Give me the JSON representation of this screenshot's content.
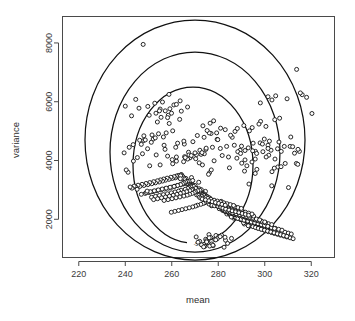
{
  "figure": {
    "kind": "scatterplot-with-density-contours",
    "background": "#ffffff",
    "frame_color": "#4a4a4a",
    "point_stroke": "#111111",
    "point_fill": "#ffffff",
    "contour_color": "#111111"
  },
  "chart_data": {
    "type": "scatter",
    "title": "",
    "xlabel": "mean",
    "ylabel": "variance",
    "xlim": [
      213,
      330
    ],
    "ylim": [
      700,
      8900
    ],
    "grid": false,
    "legend": null,
    "xticks": [
      220,
      240,
      260,
      280,
      300,
      320
    ],
    "xticklabels": [
      "220",
      "240",
      "260",
      "280",
      "300",
      "320"
    ],
    "yticks": [
      2000,
      4000,
      6000,
      8000
    ],
    "yticklabels": [
      "2000",
      "4000",
      "6000",
      "8000"
    ],
    "marker": "open-circle",
    "n_points": 733,
    "cluster_center": [
      277,
      2650
    ],
    "contour_labels": [
      "-5.5"
    ],
    "contours": [
      {
        "level": "outer",
        "cx": 278,
        "cy": 3200,
        "rx": 48,
        "ry": 4050,
        "label": null
      },
      {
        "level": "middle",
        "cx": 278,
        "cy": 2950,
        "rx": 37,
        "ry": 3050,
        "label": null
      },
      {
        "level": "inner",
        "cx": 277,
        "cy": 2700,
        "rx": 26,
        "ry": 2050,
        "label": "-5.5"
      }
    ],
    "x": [
      275.6,
      282.1,
      271.4,
      279.8,
      268.2,
      285.3,
      273.9,
      277.1,
      290.4,
      265.7,
      281.3,
      274.5,
      269.8,
      288.2,
      276.4,
      272.0,
      283.7,
      266.3,
      279.1,
      291.5,
      270.6,
      277.8,
      284.9,
      263.4,
      274.2,
      286.6,
      268.9,
      280.5,
      273.1,
      292.8,
      266.8,
      278.3,
      285.1,
      271.7,
      275.0,
      289.6,
      264.2,
      282.4,
      276.9,
      269.3,
      287.5,
      273.4,
      280.8,
      265.1,
      277.2,
      291.0,
      270.1,
      284.2,
      274.8,
      267.6,
      281.9,
      288.9,
      272.6,
      276.1,
      293.4,
      268.4,
      279.5,
      285.8,
      271.0,
      274.3,
      290.2,
      266.1,
      283.1,
      277.6,
      269.9,
      286.3,
      272.9,
      280.1,
      264.8,
      275.4,
      292.1,
      270.8,
      284.7,
      273.6,
      268.1,
      282.6,
      289.3,
      271.3,
      276.7,
      294.0,
      267.2,
      279.0,
      286.9,
      270.4,
      274.9,
      291.7,
      265.5,
      283.5,
      278.1,
      268.7,
      287.8,
      273.0,
      281.2,
      263.9,
      276.3,
      292.5,
      269.6,
      285.4,
      275.1,
      267.0,
      282.0,
      290.6,
      272.2,
      277.4,
      295.1,
      266.5,
      278.6,
      288.0,
      271.8,
      273.7,
      293.0,
      264.4,
      284.0,
      276.0,
      270.0,
      287.1,
      272.4,
      280.4,
      262.7,
      275.7,
      291.2,
      269.1,
      285.9,
      274.0,
      267.9,
      283.3,
      288.5,
      270.9,
      277.0,
      296.2,
      265.9,
      279.7,
      286.1,
      272.7,
      275.3,
      290.9,
      263.1,
      284.5,
      278.8,
      269.4,
      287.3,
      273.3,
      281.6,
      262.0,
      276.6,
      293.7,
      270.3,
      286.4,
      275.9,
      266.7,
      282.9,
      291.9,
      271.5,
      278.0,
      297.0,
      264.9,
      280.2,
      289.0,
      272.1,
      274.6,
      294.5,
      261.5,
      285.0,
      277.3,
      268.3,
      288.3,
      273.8,
      282.2,
      261.0,
      275.2,
      292.9,
      269.0,
      287.0,
      274.4,
      266.0,
      284.3,
      290.0,
      270.7,
      278.9,
      298.3,
      263.6,
      281.0,
      285.6,
      271.2,
      276.5,
      295.8,
      260.2,
      286.0,
      278.4,
      267.4,
      289.5,
      272.3,
      283.0,
      259.6,
      274.1,
      294.9,
      268.6,
      288.6,
      275.8,
      265.3,
      285.5,
      292.4,
      271.6,
      279.4,
      299.5,
      262.3,
      281.8,
      287.6,
      270.2,
      277.9,
      297.6,
      258.8,
      286.8,
      279.9,
      266.9,
      290.3,
      273.2,
      284.1,
      258.0,
      273.5,
      296.0,
      267.8,
      289.8,
      276.2,
      264.6,
      286.5,
      293.6,
      272.8,
      280.7,
      300.4,
      261.2,
      282.8,
      288.4,
      269.7,
      278.5,
      298.9,
      257.3,
      287.9,
      281.1,
      265.8,
      291.4,
      274.7,
      285.2,
      256.5,
      272.5,
      297.2,
      266.4,
      290.8,
      277.5,
      263.8,
      287.4,
      294.8,
      271.9,
      282.3,
      301.6,
      260.0,
      283.9,
      289.9,
      268.8,
      279.3,
      300.1,
      256.0,
      289.1,
      282.0,
      264.0,
      292.6,
      275.5,
      286.2,
      255.1,
      271.1,
      298.5,
      265.0,
      292.0,
      278.7,
      262.5,
      288.8,
      296.1,
      272.5,
      283.4,
      302.9,
      258.6,
      285.1,
      291.1,
      267.7,
      280.6,
      301.3,
      254.6,
      290.5,
      283.2,
      262.9,
      294.0,
      276.8,
      287.7,
      253.8,
      270.2,
      299.9,
      263.7,
      293.3,
      280.0,
      261.0,
      290.1,
      297.5,
      273.1,
      284.8,
      304.1,
      257.0,
      286.7,
      292.7,
      266.6,
      281.5,
      302.8,
      253.0,
      291.8,
      284.6,
      261.4,
      295.6,
      278.2,
      289.2,
      252.2,
      269.0,
      301.2,
      262.2,
      294.6,
      281.4,
      259.3,
      291.6,
      299.0,
      274.5,
      286.1,
      305.5,
      255.4,
      288.1,
      294.2,
      265.2,
      283.0,
      304.4,
      251.4,
      293.2,
      286.0,
      259.8,
      297.1,
      279.6,
      290.7,
      250.5,
      267.5,
      302.6,
      260.6,
      296.0,
      282.9,
      257.6,
      293.0,
      300.4,
      276.0,
      287.5,
      306.8,
      253.7,
      289.6,
      295.7,
      263.5,
      284.4,
      305.9,
      249.7,
      294.7,
      287.5,
      258.1,
      298.6,
      281.0,
      292.1,
      248.9,
      266.0,
      304.0,
      259.0,
      297.4,
      284.3,
      255.9,
      294.4,
      301.8,
      277.4,
      288.9,
      308.2,
      252.0,
      291.0,
      297.1,
      261.8,
      285.9,
      307.3,
      248.0,
      296.1,
      288.9,
      256.4,
      300.0,
      282.4,
      293.6,
      247.2,
      264.4,
      305.4,
      257.3,
      298.8,
      285.7,
      254.2,
      295.8,
      303.2,
      278.8,
      290.3,
      309.5,
      250.3,
      292.4,
      298.5,
      260.1,
      287.3,
      308.7,
      246.3,
      297.5,
      290.3,
      254.7,
      301.4,
      283.8,
      295.0,
      245.5,
      262.9,
      306.8,
      255.6,
      300.2,
      287.1,
      252.5,
      297.2,
      304.6,
      280.2,
      291.7,
      310.9,
      248.6,
      293.8,
      299.9,
      258.4,
      288.7,
      310.1,
      244.6,
      298.9,
      291.7,
      253.0,
      302.8,
      285.2,
      296.4,
      243.8,
      261.3,
      308.1,
      253.9,
      301.6,
      288.5,
      250.8,
      298.6,
      306.0,
      281.6,
      293.1,
      312.2,
      246.9,
      295.2,
      301.3,
      256.7,
      290.1,
      311.4,
      242.9,
      300.3,
      293.1,
      251.3,
      304.2,
      286.6,
      297.8,
      242.1,
      259.8,
      309.5,
      252.2,
      303.0,
      289.9,
      249.1,
      300.0,
      307.4,
      283.0,
      294.5,
      313.6,
      245.2,
      296.6,
      302.7,
      255.0,
      291.5,
      312.8,
      241.2,
      301.7,
      294.5,
      249.6,
      305.6,
      288.0,
      299.2,
      240.4,
      258.2,
      310.9,
      250.5,
      304.4,
      291.3,
      247.4,
      301.4,
      308.8,
      284.4,
      295.9,
      314.9,
      243.5,
      298.0,
      304.1,
      253.3,
      292.9,
      314.2,
      239.5,
      303.1,
      295.9,
      247.9,
      307.0,
      289.4,
      300.6,
      276.2,
      274.0,
      279.5,
      271.8,
      283.6,
      277.0,
      269.5,
      286.0,
      273.2,
      280.9,
      267.8,
      275.8,
      288.4,
      271.0,
      278.2,
      265.4,
      284.8,
      272.6,
      276.9,
      290.1,
      269.1,
      281.7,
      263.8,
      274.7,
      287.2,
      270.3,
      279.8,
      292.3,
      267.2,
      283.0,
      262.0,
      273.9,
      289.6,
      268.5,
      277.5,
      294.6,
      265.5,
      285.3,
      260.4,
      272.1,
      291.0,
      266.8,
      276.1,
      296.0,
      263.7,
      286.9,
      258.9,
      270.6,
      293.4,
      265.1,
      274.8,
      298.2,
      262.0,
      288.2,
      257.1,
      269.0,
      295.0,
      263.4,
      273.0,
      300.5,
      260.2,
      290.0,
      255.4,
      267.4,
      297.5,
      261.7,
      271.6,
      302.0,
      258.5,
      291.5,
      253.8,
      265.8,
      299.0,
      259.9,
      270.0,
      304.3,
      256.7,
      293.2,
      252.0,
      264.1,
      301.4,
      258.2,
      268.4,
      306.1,
      255.0,
      294.8,
      250.3,
      262.5,
      303.0,
      256.4,
      266.8,
      308.4,
      253.2,
      296.5,
      248.6,
      260.9,
      305.5,
      254.7,
      265.2,
      310.2,
      251.5,
      298.1,
      246.9,
      259.2,
      307.1,
      252.9,
      263.6,
      312.0,
      249.7,
      299.8,
      245.1,
      257.6,
      309.6,
      251.2,
      262.0,
      314.3,
      248.0,
      301.4,
      243.4,
      256.0,
      311.2,
      249.4,
      260.4,
      316.1,
      246.2,
      303.1,
      241.7,
      254.3,
      313.7,
      247.7,
      258.8,
      318.0,
      244.5,
      304.7,
      240.0,
      252.7,
      315.3,
      245.9,
      257.2,
      320.3,
      242.7,
      306.4,
      278.0,
      276.5,
      273.4,
      281.0,
      275.2,
      279.3,
      272.0,
      284.0,
      274.6,
      277.8,
      270.5,
      282.5,
      276.0,
      273.9,
      285.7,
      271.3,
      279.0,
      274.2,
      283.1,
      276.8,
      272.8,
      280.3,
      275.6,
      278.5,
      273.7,
      281.4,
      277.2,
      274.9,
      282.9,
      276.3,
      279.6,
      275.0,
      280.8,
      277.7,
      278.9,
      276.1,
      277.4,
      279.1,
      275.4,
      278.3
    ],
    "y": [
      2650,
      2380,
      2910,
      2540,
      3120,
      2230,
      2780,
      2460,
      2090,
      3340,
      2610,
      2950,
      3080,
      2310,
      2720,
      2870,
      2180,
      3260,
      2490,
      1960,
      3010,
      2600,
      2270,
      3480,
      2840,
      2040,
      3190,
      2430,
      2760,
      1870,
      3300,
      2520,
      2150,
      2980,
      2700,
      1990,
      3520,
      2350,
      2580,
      3140,
      2110,
      2890,
      2410,
      3420,
      2630,
      1920,
      3050,
      2240,
      2800,
      3230,
      2300,
      2070,
      2930,
      2680,
      1820,
      3180,
      2470,
      2190,
      3020,
      2750,
      1980,
      3390,
      2260,
      2560,
      3090,
      2130,
      2870,
      2440,
      3450,
      2700,
      1890,
      3030,
      2210,
      2820,
      3160,
      2340,
      2060,
      2960,
      2620,
      1790,
      3250,
      2510,
      2170,
      3070,
      2730,
      1930,
      3370,
      2280,
      2540,
      3130,
      2100,
      2840,
      2390,
      3510,
      2660,
      1860,
      3100,
      2220,
      2780,
      3280,
      2320,
      2050,
      2900,
      2590,
      1760,
      3210,
      2480,
      2140,
      3040,
      2710,
      1900,
      3400,
      2250,
      2520,
      3150,
      2080,
      2860,
      2360,
      3490,
      2640,
      1840,
      3070,
      2200,
      2760,
      3310,
      2290,
      2030,
      2880,
      2570,
      1730,
      3230,
      2460,
      2120,
      3010,
      2690,
      1880,
      3430,
      2230,
      2500,
      3120,
      2060,
      2830,
      2340,
      3470,
      2610,
      1810,
      3050,
      2180,
      2740,
      3290,
      2270,
      2010,
      2850,
      2550,
      1700,
      3200,
      2440,
      2100,
      2990,
      2670,
      1850,
      3410,
      2210,
      2480,
      3100,
      2040,
      2810,
      2320,
      3450,
      2590,
      1780,
      3020,
      2160,
      2710,
      3270,
      2250,
      1990,
      2830,
      2530,
      1670,
      3180,
      2420,
      2080,
      2970,
      2650,
      1830,
      3390,
      2190,
      2460,
      3080,
      2010,
      2790,
      2300,
      3430,
      2560,
      1750,
      3000,
      2140,
      2690,
      3240,
      2230,
      1960,
      2810,
      2500,
      1640,
      3150,
      2400,
      2060,
      2940,
      2630,
      1800,
      3360,
      2170,
      2440,
      3050,
      1990,
      2770,
      2280,
      3400,
      2540,
      1720,
      2970,
      2120,
      2670,
      3210,
      2210,
      1930,
      2780,
      2480,
      1610,
      3120,
      2380,
      2030,
      2910,
      2600,
      1770,
      3330,
      2150,
      2410,
      3020,
      1960,
      2740,
      2250,
      3370,
      2510,
      1690,
      2940,
      2090,
      2640,
      3180,
      2180,
      1900,
      2750,
      2450,
      1580,
      3090,
      2350,
      2000,
      2880,
      2570,
      1740,
      3300,
      2120,
      2380,
      2990,
      1930,
      2710,
      2220,
      3340,
      2480,
      1660,
      2910,
      2060,
      2610,
      3150,
      2150,
      1870,
      2720,
      2420,
      1550,
      3060,
      2320,
      1970,
      2850,
      2540,
      1710,
      3270,
      2090,
      2350,
      2960,
      1900,
      2680,
      2190,
      3310,
      2450,
      1630,
      2880,
      2030,
      2580,
      3120,
      2120,
      1840,
      2690,
      2390,
      1520,
      3030,
      2290,
      1940,
      2820,
      2510,
      1680,
      3240,
      2060,
      2320,
      2930,
      1870,
      2650,
      2160,
      3280,
      2420,
      1600,
      2850,
      2000,
      2550,
      3090,
      2090,
      1810,
      2660,
      2360,
      1490,
      3000,
      2260,
      1910,
      2790,
      2480,
      1650,
      3210,
      2030,
      2290,
      2900,
      1840,
      2620,
      2130,
      3250,
      2390,
      1570,
      2820,
      1970,
      2520,
      3060,
      2060,
      1780,
      2630,
      2330,
      1460,
      2970,
      2230,
      1880,
      2760,
      2450,
      1620,
      3180,
      2000,
      2260,
      2870,
      1810,
      2590,
      2100,
      3220,
      2360,
      1540,
      2790,
      1940,
      2490,
      3030,
      2030,
      1750,
      2600,
      2300,
      1430,
      2940,
      2200,
      1850,
      2730,
      2420,
      1590,
      3150,
      1970,
      2230,
      2840,
      1780,
      2560,
      2070,
      3190,
      2330,
      1510,
      2760,
      1910,
      2460,
      3000,
      2000,
      1720,
      2570,
      2270,
      1400,
      2910,
      2170,
      1820,
      2700,
      2390,
      1560,
      3120,
      1940,
      2200,
      2810,
      1750,
      2530,
      2040,
      3160,
      2300,
      1480,
      2730,
      1880,
      2430,
      2970,
      1970,
      1690,
      2540,
      2240,
      1370,
      2880,
      2140,
      1790,
      2670,
      2360,
      1530,
      3090,
      1910,
      2170,
      2780,
      1720,
      2500,
      2010,
      3130,
      2270,
      1450,
      2700,
      1850,
      2400,
      2940,
      1940,
      1660,
      2510,
      2210,
      1340,
      2850,
      2110,
      1760,
      2640,
      2330,
      1500,
      3060,
      1880,
      2140,
      2750,
      1690,
      2470,
      1980,
      3100,
      2240,
      1420,
      2670,
      1820,
      2370,
      2910,
      1910,
      1630,
      2480,
      2180,
      3900,
      4100,
      3700,
      4350,
      3850,
      4020,
      4250,
      3600,
      4180,
      3950,
      4400,
      3780,
      4080,
      4300,
      3680,
      4150,
      4480,
      3820,
      4050,
      3640,
      4230,
      4520,
      3900,
      4120,
      3560,
      4310,
      3980,
      4600,
      3740,
      4190,
      4430,
      3870,
      4260,
      3620,
      4050,
      4680,
      3790,
      4350,
      4120,
      3580,
      4230,
      4720,
      3920,
      4480,
      3680,
      4140,
      4790,
      3850,
      4410,
      4090,
      3530,
      4300,
      4850,
      3990,
      4560,
      3750,
      4210,
      4920,
      3910,
      4640,
      4170,
      3480,
      4380,
      4990,
      4060,
      4710,
      3820,
      4280,
      5050,
      3980,
      4790,
      4240,
      3420,
      4450,
      5120,
      4130,
      4860,
      3890,
      4350,
      5190,
      4050,
      4940,
      4310,
      3380,
      4520,
      5260,
      4200,
      5010,
      3960,
      4420,
      5330,
      4120,
      5090,
      4380,
      3320,
      4590,
      5400,
      4270,
      5160,
      4030,
      4490,
      5470,
      4190,
      5240,
      4450,
      3260,
      4660,
      5540,
      4340,
      5310,
      4100,
      4560,
      5610,
      4260,
      5390,
      4520,
      3200,
      4730,
      5680,
      4410,
      5460,
      4170,
      4630,
      5750,
      4330,
      5540,
      4590,
      3140,
      4800,
      5820,
      4480,
      5610,
      4240,
      4700,
      5890,
      4400,
      5690,
      4660,
      3080,
      4870,
      5960,
      4550,
      5760,
      4310,
      4770,
      6030,
      4470,
      5840,
      4730,
      3020,
      4940,
      6100,
      4620,
      5910,
      4380,
      4840,
      6170,
      4540,
      5990,
      4800,
      2960,
      5010,
      6240,
      4690,
      6060,
      4450,
      4910,
      7100,
      7950,
      6250,
      6150,
      6080,
      6200,
      5850,
      5950,
      6300,
      5780,
      5690,
      5600,
      5520,
      5440,
      5350,
      5270,
      5180,
      5100,
      5020,
      4940,
      1250,
      1180,
      1320,
      1100,
      1400,
      1050,
      1480,
      1150,
      1350,
      1220,
      1450,
      1080,
      1290,
      1380,
      1130,
      1420,
      1200,
      1310,
      1060,
      1460,
      1160,
      1270,
      1390,
      1090,
      1340,
      1230,
      1410,
      1120,
      1300,
      1370
    ]
  },
  "labels": {
    "xaxis_title": "mean",
    "yaxis_title": "variance",
    "contour_inner_label": "-5.5"
  }
}
